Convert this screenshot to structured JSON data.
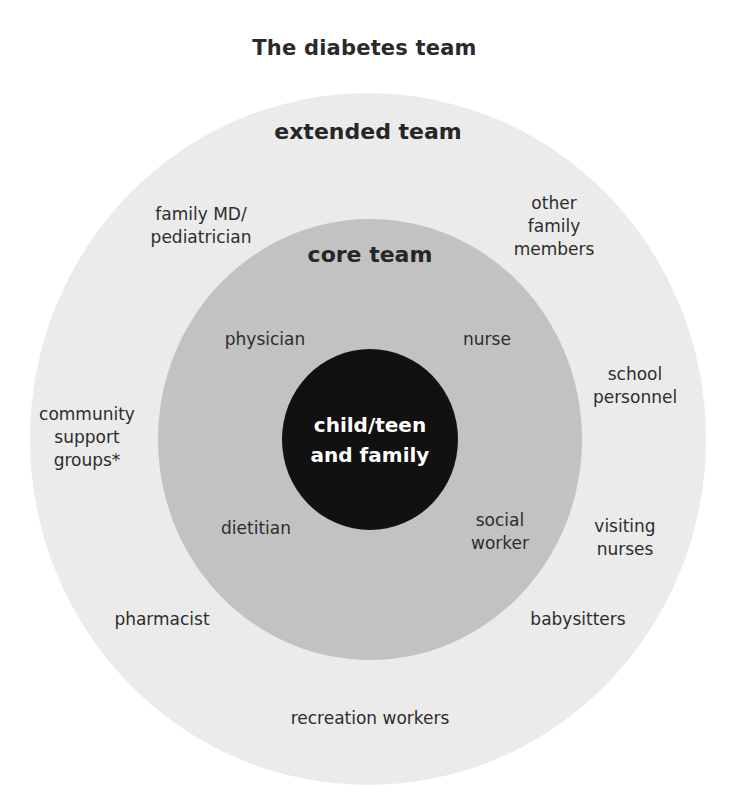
{
  "title": "The diabetes team",
  "colors": {
    "background": "#ffffff",
    "extended_ring": "#ebebeb",
    "core_ring": "#c2c2c2",
    "center": "#111111",
    "text": "#2d2d2d",
    "center_text": "#ffffff"
  },
  "diagram": {
    "type": "concentric-circles",
    "center": {
      "label": "child/teen\nand family"
    },
    "core_team": {
      "heading": "core team",
      "members": [
        "physician",
        "nurse",
        "dietitian",
        "social\nworker"
      ]
    },
    "extended_team": {
      "heading": "extended team",
      "members": [
        "family MD/\npediatrician",
        "other\nfamily\nmembers",
        "school\npersonnel",
        "community\nsupport\ngroups*",
        "visiting\nnurses",
        "pharmacist",
        "babysitters",
        "recreation workers"
      ]
    }
  }
}
